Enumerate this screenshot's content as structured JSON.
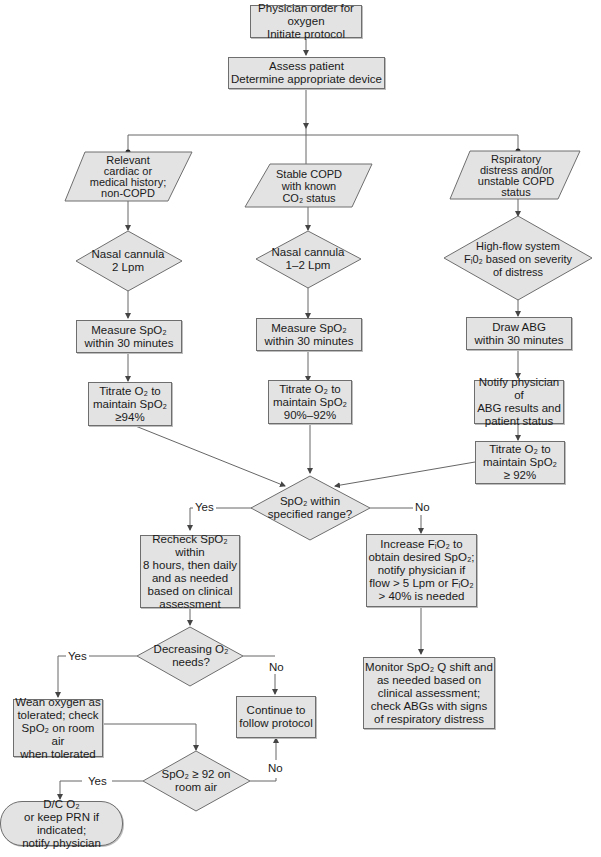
{
  "colors": {
    "fill": "#e3e3e3",
    "stroke": "#6e6e6e",
    "line": "#555555"
  },
  "nodes": {
    "start": "Physician order for oxygen\nInitiate protocol",
    "assess": "Assess patient\nDetermine appropriate device",
    "cond_left": "Relevant\ncardiac or\nmedical history;\nnon-COPD",
    "cond_mid": "Stable COPD\nwith known\nCO₂ status",
    "cond_right": "Rspiratory\ndistress and/or\nunstable COPD\nstatus",
    "device_left": "Nasal cannula\n2 Lpm",
    "device_mid": "Nasal cannula\n1–2 Lpm",
    "device_right": "High-flow system\nFᵢ0₂ based on severity\nof distress",
    "measure_left": "Measure SpO₂\nwithin 30 minutes",
    "measure_mid": "Measure SpO₂\nwithin 30 minutes",
    "abg_right": "Draw ABG\nwithin 30 minutes",
    "notify_right": "Notify physician of\nABG results and\npatient status",
    "titrate_left": "Titrate O₂ to\nmaintain SpO₂\n≥94%",
    "titrate_mid": "Titrate O₂ to\nmaintain SpO₂\n90%–92%",
    "titrate_right": "Titrate O₂ to\nmaintain SpO₂\n≥ 92%",
    "decision_range": "SpO₂ within\nspecified range?",
    "recheck": "Recheck SpO₂ within\n8 hours, then daily\nand as needed\nbased on clinical\nassessment",
    "increase": "Increase FᵢO₂ to\nobtain desired SpO₂;\nnotify physician if\nflow > 5 Lpm or FᵢO₂\n> 40% is needed",
    "monitor": "Monitor SpO₂ Q shift and\nas needed based on\nclinical assessment;\ncheck ABGs with signs\nof respiratory distress",
    "decision_decreasing": "Decreasing O₂\nneeds?",
    "wean": "Wean oxygen as\ntolerated; check\nSpO₂ on room air\nwhen tolerated",
    "continue": "Continue to\nfollow protocol",
    "decision_room_air": "SpO₂ ≥ 92 on\nroom air",
    "end": "D/C O₂\nor keep PRN if indicated;\nnotify physician"
  },
  "labels": {
    "range_yes": "Yes",
    "range_no": "No",
    "decreasing_yes": "Yes",
    "decreasing_no": "No",
    "room_air_yes": "Yes",
    "room_air_no": "No"
  }
}
